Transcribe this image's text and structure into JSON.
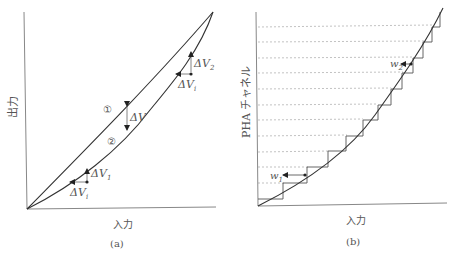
{
  "panel_a": {
    "caption": "(a)",
    "x_axis_label": "入力",
    "y_axis_label": "出力",
    "curve1_marker": "①",
    "curve2_marker": "②",
    "delta_v_label": "ΔV",
    "delta_v1_label": "ΔV",
    "delta_v1_sub": "1",
    "delta_v2_label": "ΔV",
    "delta_v2_sub": "2",
    "delta_vi_label": "ΔV",
    "delta_vi_sub": "i"
  },
  "panel_b": {
    "caption": "(b)",
    "x_axis_label": "入力",
    "y_axis_label": "PHA チャネル",
    "w1_label": "w",
    "w1_sub": "1",
    "w2_label": "w",
    "w2_sub": "2"
  },
  "colors": {
    "line": "#333333",
    "axis": "#888888",
    "dashed": "#999999",
    "text": "#555555"
  }
}
